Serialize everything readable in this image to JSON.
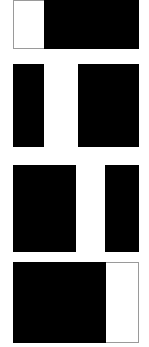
{
  "figure": {
    "title": "",
    "background_color": "#ffffff",
    "width": 149,
    "height": 347,
    "panel_count": 4,
    "orientation": "vertical-stack"
  },
  "colors": {
    "black": "#000000",
    "white": "#ffffff",
    "edge_gray": "#9a9a9a"
  },
  "panels": [
    {
      "index": "1",
      "label": "",
      "x": 13,
      "y": 0,
      "width": 126,
      "height": 49,
      "white_band_position": "left",
      "bands": [
        {
          "fill": "white",
          "x": 0,
          "width": 31
        },
        {
          "fill": "black",
          "x": 31,
          "width": 95
        }
      ]
    },
    {
      "index": "2",
      "label": "",
      "x": 13,
      "y": 64,
      "width": 126,
      "height": 83,
      "white_band_position": "left-of-center",
      "bands": [
        {
          "fill": "black",
          "x": 0,
          "width": 31
        },
        {
          "fill": "white",
          "x": 31,
          "width": 34
        },
        {
          "fill": "black",
          "x": 65,
          "width": 61
        }
      ]
    },
    {
      "index": "3",
      "label": "",
      "x": 13,
      "y": 165,
      "width": 126,
      "height": 87,
      "white_band_position": "right-of-center",
      "bands": [
        {
          "fill": "black",
          "x": 0,
          "width": 63
        },
        {
          "fill": "white",
          "x": 63,
          "width": 29
        },
        {
          "fill": "black",
          "x": 92,
          "width": 34
        }
      ]
    },
    {
      "index": "4",
      "label": "",
      "x": 13,
      "y": 262,
      "width": 126,
      "height": 81,
      "white_band_position": "right",
      "bands": [
        {
          "fill": "black",
          "x": 0,
          "width": 93
        },
        {
          "fill": "white",
          "x": 93,
          "width": 33
        }
      ]
    }
  ]
}
